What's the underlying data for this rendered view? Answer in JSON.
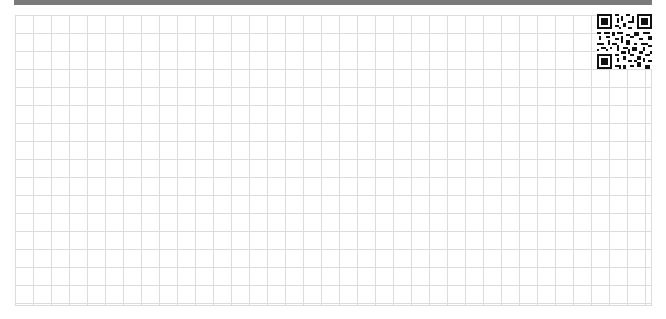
{
  "page": {
    "type": "grid-paper",
    "top_bar_color": "#7a7a7a",
    "grid_line_color": "#dcdcdc",
    "grid_cell_size_px": 18
  },
  "qr_code": {
    "icon": "qr-code-icon"
  }
}
